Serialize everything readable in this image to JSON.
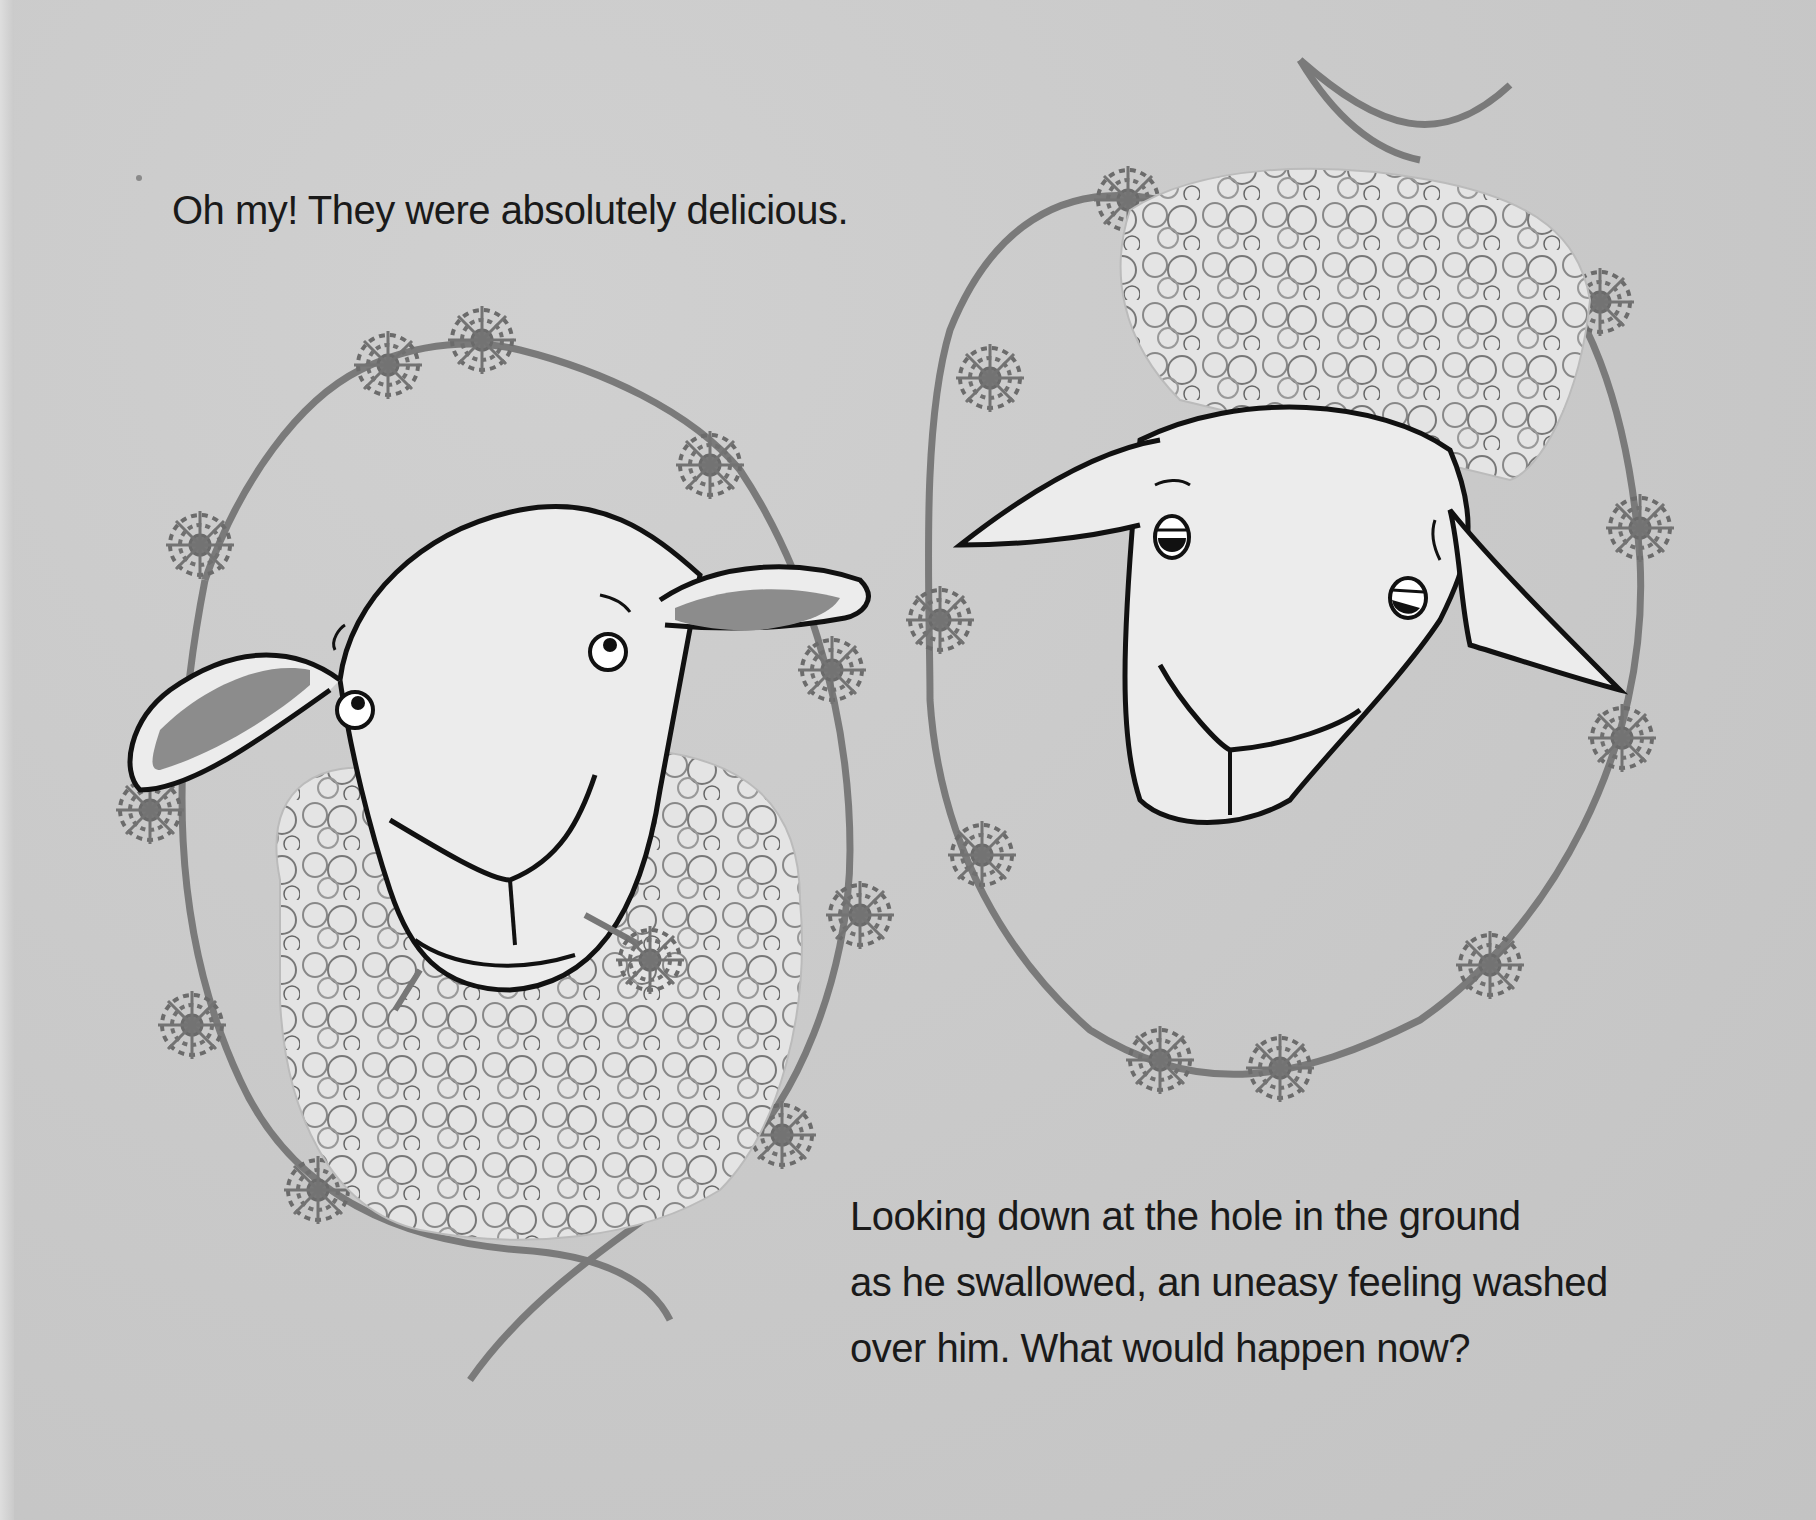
{
  "page": {
    "background_color": "#c9c9c9",
    "ink_color": "#1a1a1a",
    "flower_color": "#6e6e6e"
  },
  "text": {
    "top": "Oh my! They were absolutely delicious.",
    "bottom_lines": [
      "Looking down at the hole in the ground",
      "as he swallowed, an uneasy feeling washed",
      "over him. What would happen now?"
    ]
  },
  "illustration": {
    "left_sheep": {
      "description": "Sheep looking up with a dandelion in its mouth, framed by a dandelion chain",
      "expression": "eyes looking up, smiling"
    },
    "right_sheep": {
      "description": "Sheep head with curly wool top, framed by a dandelion chain",
      "expression": "eyes glancing sideways, smiling"
    }
  }
}
